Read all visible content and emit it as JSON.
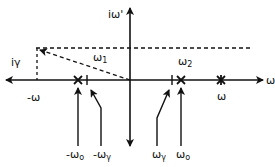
{
  "diagram": {
    "type": "complex-plane frequency diagram",
    "axes": {
      "horizontal_label": "ω",
      "vertical_label": "iω'"
    },
    "labels": {
      "i_gamma": "iγ",
      "neg_omega": "-ω",
      "omega1": "ω",
      "omega1_sub": "1",
      "omega2": "ω",
      "omega2_sub": "2",
      "omega_star": "ω",
      "neg_omega0": "-ω",
      "neg_omega0_sub": "o",
      "neg_omega_gamma": "-ω",
      "neg_omega_gamma_sub": "γ",
      "omega_gamma": "ω",
      "omega_gamma_sub": "γ",
      "omega0": "ω",
      "omega0_sub": "o"
    },
    "markers": [
      {
        "kind": "cross",
        "name": "-ω0"
      },
      {
        "kind": "tick",
        "name": "-ωγ"
      },
      {
        "kind": "tick",
        "name": "ωγ"
      },
      {
        "kind": "cross",
        "name": "ω0"
      },
      {
        "kind": "star",
        "name": "ω"
      }
    ],
    "line_color": "#111111"
  }
}
